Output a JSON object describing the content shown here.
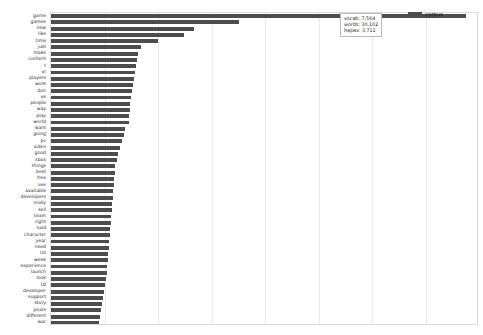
{
  "chart_data": {
    "type": "bar",
    "orientation": "horizontal",
    "title": "",
    "xlabel": "",
    "ylabel": "",
    "grid": true,
    "legend_position": "top-right",
    "xlim": [
      0,
      8760
    ],
    "xticks": [
      0,
      1095,
      2190,
      3285,
      4380,
      5475,
      6570,
      7665,
      8760
    ],
    "series": [
      {
        "name": "corpus",
        "color": "#4d4d4d"
      }
    ],
    "categories": [
      "game",
      "games",
      "new",
      "like",
      "time",
      "just",
      "make",
      "content",
      "t",
      "vr",
      "players",
      "work",
      "don",
      "ve",
      "people",
      "way",
      "play",
      "world",
      "want",
      "going",
      "pc",
      "video",
      "good",
      "xbox",
      "things",
      "best",
      "free",
      "use",
      "available",
      "developers",
      "really",
      "sell",
      "team",
      "right",
      "said",
      "character",
      "year",
      "need",
      "lot",
      "week",
      "experience",
      "launch",
      "look",
      "10",
      "developer",
      "support",
      "story",
      "years",
      "different",
      "war"
    ],
    "values": [
      8500,
      3840,
      2920,
      2730,
      2190,
      1840,
      1790,
      1750,
      1730,
      1710,
      1690,
      1670,
      1650,
      1630,
      1620,
      1610,
      1600,
      1590,
      1520,
      1500,
      1450,
      1410,
      1380,
      1350,
      1320,
      1300,
      1290,
      1280,
      1270,
      1260,
      1250,
      1240,
      1230,
      1220,
      1210,
      1200,
      1190,
      1180,
      1170,
      1160,
      1150,
      1140,
      1120,
      1100,
      1080,
      1060,
      1040,
      1020,
      1000,
      980
    ]
  },
  "legend": {
    "entries": [
      {
        "label": "corpus",
        "color": "#4d4d4d"
      }
    ]
  },
  "stats_box": {
    "lines": [
      "vocab: 7,564",
      "words: 30,102",
      "hapax: 3,711"
    ],
    "vocab_label": "vocab:",
    "vocab_value": "7,564",
    "words_label": "words:",
    "words_value": "30,102",
    "hapax_label": "hapax:",
    "hapax_value": "3,711"
  },
  "colors": {
    "bar": "#4d4d4d",
    "gridline": "#e9e9e9",
    "axis_border": "#d9d9d9",
    "background": "#ffffff",
    "text": "#1d1d1d"
  }
}
